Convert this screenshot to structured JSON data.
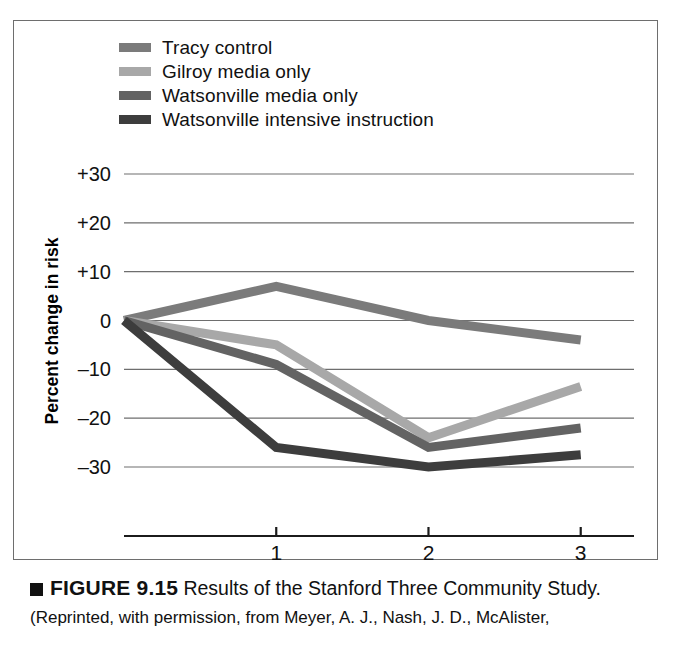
{
  "figure": {
    "marker": "■",
    "number": "FIGURE 9.15",
    "title": "Results of the Stanford Three Community Study.",
    "source": "(Reprinted, with permission, from Meyer, A. J., Nash, J. D., McAlister,"
  },
  "legend": {
    "items": [
      {
        "label": "Tracy control",
        "color": "#7b7b7b"
      },
      {
        "label": "Gilroy media only",
        "color": "#a8a8a8"
      },
      {
        "label": "Watsonville media only",
        "color": "#636363"
      },
      {
        "label": "Watsonville intensive instruction",
        "color": "#3d3d3d"
      }
    ]
  },
  "chart_data": {
    "type": "line",
    "title": "Results of the Stanford Three Community Study",
    "xlabel": "Survey",
    "ylabel": "Percent change in risk",
    "x": [
      0,
      1,
      2,
      3
    ],
    "categories": [
      "",
      "1",
      "2",
      "3"
    ],
    "xtick_labels": [
      "1",
      "2",
      "3"
    ],
    "xlim": [
      0,
      3.35
    ],
    "ylim": [
      -33,
      33
    ],
    "yticks": [
      30,
      20,
      10,
      0,
      -10,
      -20,
      -30
    ],
    "ytick_labels": [
      "+30",
      "+20",
      "+10",
      "0",
      "–10",
      "–20",
      "–30"
    ],
    "grid": "horizontal",
    "legend_position": "top-left-outside",
    "series": [
      {
        "name": "Tracy control",
        "color": "#7b7b7b",
        "values": [
          0,
          7,
          0,
          -4
        ]
      },
      {
        "name": "Gilroy media only",
        "color": "#a8a8a8",
        "values": [
          0,
          -5,
          -24,
          -13.5
        ]
      },
      {
        "name": "Watsonville media only",
        "color": "#636363",
        "values": [
          0,
          -9,
          -26,
          -22
        ]
      },
      {
        "name": "Watsonville intensive instruction",
        "color": "#3d3d3d",
        "values": [
          0,
          -26,
          -30,
          -27.5
        ]
      }
    ]
  }
}
